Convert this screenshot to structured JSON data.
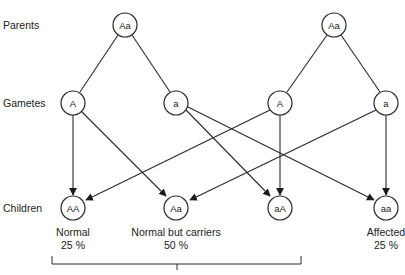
{
  "rows": {
    "parents": "Parents",
    "gametes": "Gametes",
    "children": "Children"
  },
  "parents": [
    {
      "genotype": "Aa",
      "x": 125,
      "y": 25
    },
    {
      "genotype": "Aa",
      "x": 334,
      "y": 25
    }
  ],
  "gametes": [
    {
      "allele": "A",
      "x": 73,
      "y": 103
    },
    {
      "allele": "a",
      "x": 176,
      "y": 103
    },
    {
      "allele": "A",
      "x": 280,
      "y": 103
    },
    {
      "allele": "a",
      "x": 386,
      "y": 103
    }
  ],
  "children": [
    {
      "genotype": "AA",
      "x": 73,
      "y": 208
    },
    {
      "genotype": "Aa",
      "x": 176,
      "y": 208
    },
    {
      "genotype": "aA",
      "x": 280,
      "y": 208
    },
    {
      "genotype": "aa",
      "x": 386,
      "y": 208
    }
  ],
  "outcomes": [
    {
      "label": "Normal",
      "percent": "25 %",
      "x": 73
    },
    {
      "label": "Normal but carriers",
      "percent": "50 %",
      "x": 176
    },
    {
      "label": "Affected",
      "percent": "25 %",
      "x": 386
    }
  ],
  "colors": {
    "stroke": "#2a2a2a",
    "background": "#ffffff"
  }
}
